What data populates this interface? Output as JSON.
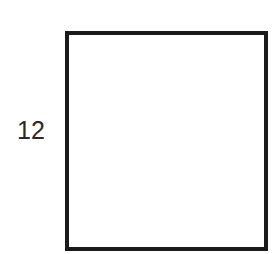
{
  "diagram": {
    "shape": "square",
    "side_label": "12",
    "border_color": "#1a1a1a",
    "fill_color": "#ffffff",
    "label_color": "#2a2a2a"
  }
}
